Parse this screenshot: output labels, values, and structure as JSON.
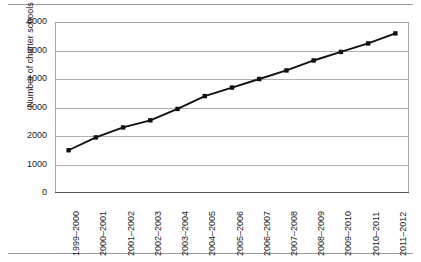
{
  "figure": {
    "top_rule": "",
    "bottom_rule": ""
  },
  "chart_data": {
    "type": "line",
    "title": "",
    "xlabel": "",
    "ylabel": "Number of charter schools",
    "categories": [
      "1999–2000",
      "2000–2001",
      "2001–2002",
      "2002–2003",
      "2003–2004",
      "2004–2005",
      "2005–2006",
      "2006–2007",
      "2007–2008",
      "2008–2009",
      "2009–2010",
      "2010–2011",
      "2011–2012"
    ],
    "values": [
      1500,
      1950,
      2300,
      2550,
      2950,
      3400,
      3700,
      4000,
      4300,
      4650,
      4950,
      5250,
      5600
    ],
    "ylim": [
      0,
      6000
    ],
    "yticks": [
      0,
      1000,
      2000,
      3000,
      4000,
      5000,
      6000
    ],
    "ytick_labels": [
      "0",
      "1000",
      "2000",
      "3000",
      "4000",
      "5000",
      "6000"
    ],
    "grid": "horizontal",
    "legend": "none",
    "marker": "square",
    "line_color": "#111111",
    "grid_color": "#b0b0b0"
  }
}
